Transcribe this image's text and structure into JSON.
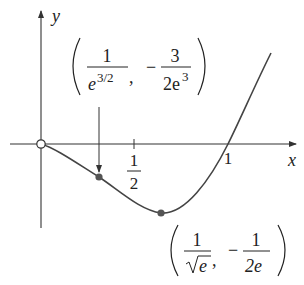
{
  "figure": {
    "axes": {
      "x_label": "x",
      "y_label": "y",
      "x_ticks": [
        {
          "numerator": "1",
          "denominator": "2",
          "value": 0.5
        },
        {
          "label": "1",
          "value": 1
        }
      ]
    },
    "points": {
      "origin": {
        "type": "open-circle",
        "x": 0,
        "y": 0
      },
      "inflection": {
        "type": "filled-dot",
        "x_num": "1",
        "x_den_base": "e",
        "x_den_exp": "3/2",
        "sep": ",",
        "minus": "−",
        "y_num": "3",
        "y_den": "2e",
        "y_den_exp": "3"
      },
      "minimum": {
        "type": "filled-dot",
        "x_num": "1",
        "x_den": "e",
        "sep": ",",
        "minus": "−",
        "y_num": "1",
        "y_den": "2e"
      }
    },
    "colors": {
      "curve": "#444444",
      "axis": "#333333",
      "dot": "#555555",
      "background": "#ffffff"
    }
  }
}
